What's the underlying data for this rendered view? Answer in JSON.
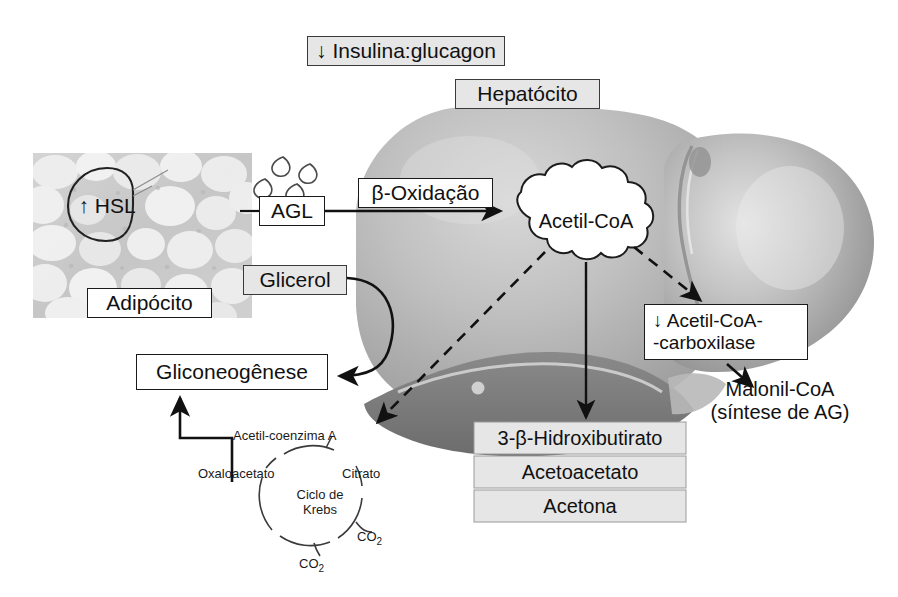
{
  "figure": {
    "background": "#ffffff",
    "width": 898,
    "height": 597
  },
  "colors": {
    "box_fill": "#e6e6e6",
    "box_stroke": "#3a3a3a",
    "white_box_fill": "#ffffff",
    "text": "#111111",
    "liver_light": "#c9c9c9",
    "liver_mid": "#a8a8a8",
    "liver_dark": "#7e7e7e",
    "adipose_bg": "#cfcfcf",
    "adipose_cell": "#f4f4f4",
    "arrow": "#111111"
  },
  "labels": {
    "insulina_glucagon": "↓ Insulina:glucagon",
    "hepatocito": "Hepatócito",
    "beta_oxidacao": "β-Oxidação",
    "agl": "AGL",
    "adipocito": "Adipócito",
    "hsl": "↑ HSL",
    "glicerol": "Glicerol",
    "gliconeogenese": "Gliconeogênese",
    "acetil_coa": "Acetil-CoA",
    "carboxilase_line1": "↓ Acetil-CoA-",
    "carboxilase_line2": "-carboxilase",
    "malonil_line1": "Malonil-CoA",
    "malonil_line2": "(síntese de AG)"
  },
  "ketone_bodies": {
    "heading": "Corpos cetónicos",
    "items": [
      "3-β-Hidroxibutirato",
      "Acetoacetato",
      "Acetona"
    ]
  },
  "krebs": {
    "center_line1": "Ciclo de",
    "center_line2": "Krebs",
    "acetyl": "Acetil-coenzima A",
    "oxaloacetate": "Oxaloacetato",
    "citrate": "Citrato",
    "co2_right": "CO",
    "co2_right_sub": "2",
    "co2_bottom": "CO",
    "co2_bottom_sub": "2"
  },
  "arrows": [
    {
      "name": "agl-to-beta-oxidation",
      "style": "solid",
      "from": "AGL",
      "to": "Acetil-CoA"
    },
    {
      "name": "acetilcoa-to-krebs",
      "style": "dashed",
      "from": "Acetil-CoA",
      "to": "Ciclo de Krebs"
    },
    {
      "name": "acetilcoa-to-ketones",
      "style": "solid",
      "from": "Acetil-CoA",
      "to": "3-β-Hidroxibutirato"
    },
    {
      "name": "acetilcoa-to-carboxilase",
      "style": "dashed",
      "from": "Acetil-CoA",
      "to": "Acetil-CoA-carboxilase"
    },
    {
      "name": "carboxilase-to-malonil",
      "style": "solid",
      "from": "Acetil-CoA-carboxilase",
      "to": "Malonil-CoA"
    },
    {
      "name": "glicerol-to-gliconeogenese",
      "style": "solid-curved",
      "from": "Glicerol",
      "to": "Gliconeogênese"
    },
    {
      "name": "krebs-to-gliconeogenese",
      "style": "solid-elbow",
      "from": "Oxaloacetato",
      "to": "Gliconeogênese"
    }
  ]
}
